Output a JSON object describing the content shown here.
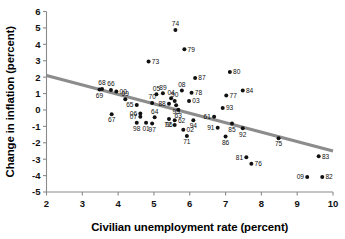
{
  "chart_data": {
    "type": "scatter",
    "title": "",
    "xlabel": "Civilian unemployment rate (percent)",
    "ylabel": "Change in inflation (percent)",
    "xlim": [
      2,
      10
    ],
    "ylim": [
      -5,
      6
    ],
    "xticks": [
      "2",
      "3",
      "4",
      "5",
      "6",
      "7",
      "8",
      "9",
      "10"
    ],
    "yticks": [
      "6",
      "5",
      "4",
      "3",
      "2",
      "1",
      "0",
      "-1",
      "-2",
      "-3",
      "-4",
      "-5"
    ],
    "grid": false,
    "legend": "none",
    "point_color": "#111111",
    "trend_color": "#8c8c8c",
    "axis_color": "#8a8a8a",
    "trendline": {
      "label": "fitted regression line",
      "x_start": 2.0,
      "y_start": 2.1,
      "x_end": 10.0,
      "y_end": -2.5
    },
    "series": [
      {
        "name": "Year observations",
        "points": [
          {
            "label": "74",
            "x": 5.6,
            "y": 4.88,
            "lpos": "above"
          },
          {
            "label": "79",
            "x": 5.85,
            "y": 3.7,
            "lpos": "right"
          },
          {
            "label": "73",
            "x": 4.85,
            "y": 2.95,
            "lpos": "right"
          },
          {
            "label": "80",
            "x": 7.12,
            "y": 2.32,
            "lpos": "right"
          },
          {
            "label": "87",
            "x": 6.15,
            "y": 1.95,
            "lpos": "right"
          },
          {
            "label": "68",
            "x": 3.55,
            "y": 1.28,
            "lpos": "above"
          },
          {
            "label": "66",
            "x": 3.8,
            "y": 1.22,
            "lpos": "above"
          },
          {
            "label": "69",
            "x": 3.48,
            "y": 1.25,
            "lpos": "below"
          },
          {
            "label": "00",
            "x": 3.95,
            "y": 1.12,
            "lpos": "right"
          },
          {
            "label": "84",
            "x": 7.48,
            "y": 1.18,
            "lpos": "right"
          },
          {
            "label": "08",
            "x": 5.78,
            "y": 1.18,
            "lpos": "above"
          },
          {
            "label": "78",
            "x": 6.05,
            "y": 1.05,
            "lpos": "right"
          },
          {
            "label": "05",
            "x": 5.07,
            "y": 0.95,
            "lpos": "above"
          },
          {
            "label": "89",
            "x": 5.25,
            "y": 1.02,
            "lpos": "above"
          },
          {
            "label": "77",
            "x": 7.02,
            "y": 0.88,
            "lpos": "right"
          },
          {
            "label": "04",
            "x": 5.48,
            "y": 0.72,
            "lpos": "above"
          },
          {
            "label": "99",
            "x": 4.2,
            "y": 0.65,
            "lpos": "above"
          },
          {
            "label": "90",
            "x": 5.58,
            "y": 0.55,
            "lpos": "above"
          },
          {
            "label": "03",
            "x": 5.98,
            "y": 0.55,
            "lpos": "right"
          },
          {
            "label": "70",
            "x": 4.95,
            "y": 0.42,
            "lpos": "above"
          },
          {
            "label": "88",
            "x": 5.42,
            "y": 0.38,
            "lpos": "left"
          },
          {
            "label": "95",
            "x": 5.62,
            "y": 0.28,
            "lpos": "below"
          },
          {
            "label": "65",
            "x": 4.52,
            "y": 0.3,
            "lpos": "left"
          },
          {
            "label": "93",
            "x": 6.92,
            "y": 0.12,
            "lpos": "right"
          },
          {
            "label": "63",
            "x": 5.68,
            "y": 0.02,
            "lpos": "below"
          },
          {
            "label": "06",
            "x": 4.62,
            "y": -0.22,
            "lpos": "left"
          },
          {
            "label": "67",
            "x": 3.82,
            "y": -0.26,
            "lpos": "below"
          },
          {
            "label": "07",
            "x": 4.62,
            "y": -0.42,
            "lpos": "left"
          },
          {
            "label": "64",
            "x": 5.02,
            "y": -0.45,
            "lpos": "above"
          },
          {
            "label": "61",
            "x": 6.68,
            "y": -0.42,
            "lpos": "left"
          },
          {
            "label": "96",
            "x": 5.42,
            "y": -0.55,
            "lpos": "below"
          },
          {
            "label": "62",
            "x": 5.58,
            "y": -0.62,
            "lpos": "right"
          },
          {
            "label": "94",
            "x": 6.1,
            "y": -0.62,
            "lpos": "below"
          },
          {
            "label": "85",
            "x": 7.18,
            "y": -0.82,
            "lpos": "below"
          },
          {
            "label": "98",
            "x": 4.52,
            "y": -0.78,
            "lpos": "below"
          },
          {
            "label": "01",
            "x": 4.78,
            "y": -0.78,
            "lpos": "below"
          },
          {
            "label": "97",
            "x": 4.95,
            "y": -0.82,
            "lpos": "below"
          },
          {
            "label": "72",
            "x": 5.58,
            "y": -0.92,
            "lpos": "left"
          },
          {
            "label": "91",
            "x": 6.78,
            "y": -1.08,
            "lpos": "left"
          },
          {
            "label": "92",
            "x": 7.48,
            "y": -1.12,
            "lpos": "below"
          },
          {
            "label": "02",
            "x": 5.82,
            "y": -1.2,
            "lpos": "right"
          },
          {
            "label": "71",
            "x": 5.92,
            "y": -1.58,
            "lpos": "below"
          },
          {
            "label": "86",
            "x": 7.0,
            "y": -1.62,
            "lpos": "below"
          },
          {
            "label": "75",
            "x": 8.48,
            "y": -1.72,
            "lpos": "below"
          },
          {
            "label": "81",
            "x": 7.58,
            "y": -2.88,
            "lpos": "left"
          },
          {
            "label": "83",
            "x": 9.6,
            "y": -2.82,
            "lpos": "right"
          },
          {
            "label": "76",
            "x": 7.72,
            "y": -3.28,
            "lpos": "right"
          },
          {
            "label": "09",
            "x": 9.28,
            "y": -4.08,
            "lpos": "left"
          },
          {
            "label": "82",
            "x": 9.7,
            "y": -4.08,
            "lpos": "right"
          }
        ]
      }
    ]
  }
}
